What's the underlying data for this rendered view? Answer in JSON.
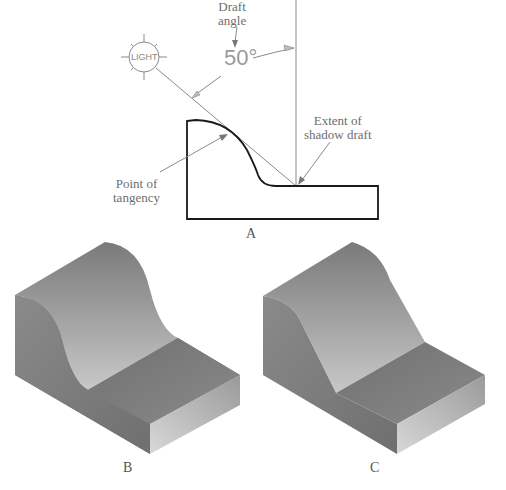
{
  "figure_a": {
    "caption": "A",
    "labels": {
      "draft_angle_line1": "Draft",
      "draft_angle_line2": "angle",
      "angle_value": "50°",
      "light": "LIGHT",
      "extent_line1": "Extent of",
      "extent_line2": "shadow draft",
      "tangency_line1": "Point of",
      "tangency_line2": "tangency"
    }
  },
  "figure_b": {
    "caption": "B"
  },
  "figure_c": {
    "caption": "C"
  },
  "colors": {
    "outline": "#1a1a1a",
    "leader": "#8a8a8a",
    "shade_dark": "#6a6a6a",
    "shade_light": "#c4c4c4"
  }
}
